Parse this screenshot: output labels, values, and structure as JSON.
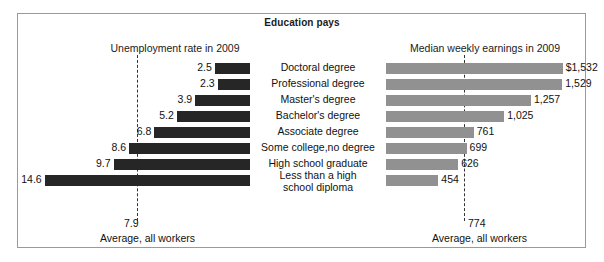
{
  "figure": {
    "title": "Education pays",
    "left_subtitle": "Unemployment rate in 2009",
    "right_subtitle": "Median weekly earnings in 2009",
    "left_footer": "Average, all workers",
    "right_footer": "Average, all workers",
    "left_average_label": "7.9",
    "right_average_label": "774",
    "bar_color_left": "#262626",
    "bar_color_right": "#919191",
    "frame_color": "#9a9a9a"
  },
  "chart_data": {
    "type": "bar",
    "title": "Education pays",
    "orientation": "horizontal",
    "grid": false,
    "legend": "none",
    "categories": [
      "Doctoral degree",
      "Professional degree",
      "Master's degree",
      "Bachelor's degree",
      "Associate degree",
      "Some college,no degree",
      "High school graduate",
      "Less than a high school diploma"
    ],
    "category_lines": [
      [
        "Doctoral degree"
      ],
      [
        "Professional degree"
      ],
      [
        "Master's degree"
      ],
      [
        "Bachelor's degree"
      ],
      [
        "Associate degree"
      ],
      [
        "Some college,no degree"
      ],
      [
        "High school graduate"
      ],
      [
        "Less than a high",
        "school diploma"
      ]
    ],
    "series": [
      {
        "name": "Unemployment rate in 2009",
        "side": "left",
        "unit": "percent",
        "xlabel": "Unemployment rate in 2009",
        "values": [
          2.5,
          2.3,
          3.9,
          5.2,
          6.8,
          8.6,
          9.7,
          14.6
        ],
        "labels": [
          "2.5",
          "2.3",
          "3.9",
          "5.2",
          "6.8",
          "8.6",
          "9.7",
          "14.6"
        ],
        "average": 7.9,
        "average_label": "7.9",
        "xlim": [
          0,
          16
        ]
      },
      {
        "name": "Median weekly earnings in 2009",
        "side": "right",
        "unit": "dollars",
        "xlabel": "Median weekly earnings in 2009",
        "values": [
          1532,
          1529,
          1257,
          1025,
          761,
          699,
          626,
          454
        ],
        "labels": [
          "$1,532",
          "1,529",
          "1,257",
          "1,025",
          "761",
          "699",
          "626",
          "454"
        ],
        "average": 774,
        "average_label": "774",
        "xlim": [
          0,
          1700
        ]
      }
    ]
  }
}
